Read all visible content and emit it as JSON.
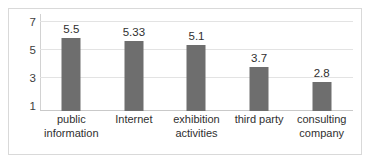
{
  "chart_data": {
    "type": "bar",
    "title": "",
    "xlabel": "",
    "ylabel": "",
    "categories": [
      "public information",
      "Internet",
      "exhibition activities",
      "third party",
      "consulting company"
    ],
    "values": [
      5.5,
      5.33,
      5.1,
      3.7,
      2.8
    ],
    "value_labels": [
      "5.5",
      "5.33",
      "5.1",
      "3.7",
      "2.8"
    ],
    "ylim": [
      1,
      7
    ],
    "ytick_labels": [
      "7",
      "5",
      "3",
      "1"
    ],
    "yticks": [
      7,
      5,
      3,
      1
    ],
    "grid": true,
    "legend": "none",
    "bar_color": "#6e6e6e",
    "gridline_color": "#e3e3e3",
    "frame_color": "#d9d9d9",
    "background": "#ffffff"
  }
}
